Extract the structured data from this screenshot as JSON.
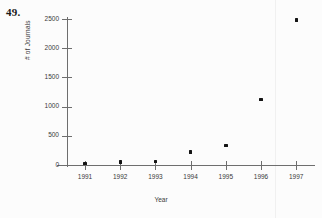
{
  "problem": {
    "number": "49."
  },
  "chart_data": {
    "type": "scatter",
    "title": "",
    "subtitle": "",
    "xlabel": "Year",
    "ylabel": "# of Journals",
    "x": [
      1991,
      1992,
      1993,
      1994,
      1995,
      1996,
      1997
    ],
    "values": [
      30,
      50,
      60,
      220,
      330,
      1120,
      2480
    ],
    "categories": [
      "1991",
      "1992",
      "1993",
      "1994",
      "1995",
      "1996",
      "1997"
    ],
    "series": [
      {
        "name": "# of Journals",
        "values": [
          30,
          50,
          60,
          220,
          330,
          1120,
          2480
        ]
      }
    ],
    "xlim": [
      1990.5,
      1997.5
    ],
    "ylim": [
      0,
      2600
    ],
    "x_ticks": [
      "1991",
      "1992",
      "1993",
      "1994",
      "1995",
      "1996",
      "1997"
    ],
    "y_ticks": [
      "0",
      "500",
      "1000",
      "1500",
      "2000",
      "2500"
    ],
    "y_tick_values": [
      0,
      500,
      1000,
      1500,
      2000,
      2500
    ],
    "grid": false,
    "legend": false,
    "legend_position": "none",
    "marker": "square",
    "marker_color": "#141414",
    "axis_color": "#6e6e6e",
    "background_color": "#fcfcfc"
  }
}
